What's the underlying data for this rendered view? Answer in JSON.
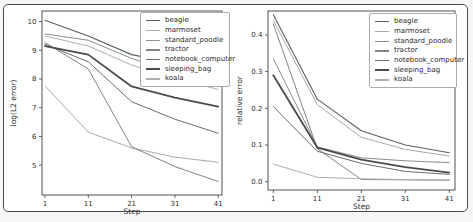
{
  "figure": {
    "background": "#ffffff",
    "frame_border_color": "#4a4a4a",
    "axis_color": "#3d3d3d",
    "text_color": "#2b2b2b"
  },
  "chart_data": [
    {
      "type": "line",
      "title": "",
      "xlabel": "Step",
      "ylabel": "log(L2 error)",
      "x": [
        1,
        11,
        21,
        31,
        41
      ],
      "xtick_labels": [
        "1",
        "11",
        "21",
        "31",
        "41"
      ],
      "ytick_values": [
        5,
        6,
        7,
        8,
        9,
        10
      ],
      "ytick_labels": [
        "5",
        "6",
        "7",
        "8",
        "9",
        "10"
      ],
      "xlim": [
        0.31,
        41.87
      ],
      "ylim": [
        3.96,
        10.37
      ],
      "grid": false,
      "legend_position": "upper right",
      "series": [
        {
          "name": "beagle",
          "color": "#566069",
          "width": 1.1,
          "values": [
            10.05,
            9.5,
            8.85,
            8.55,
            8.35
          ]
        },
        {
          "name": "marmoset",
          "color": "#a9a9a9",
          "width": 1.0,
          "values": [
            7.76,
            6.15,
            5.6,
            5.28,
            5.1
          ]
        },
        {
          "name": "standard_poodle",
          "color": "#879087",
          "width": 1.0,
          "values": [
            9.57,
            9.35,
            8.72,
            8.2,
            7.79
          ]
        },
        {
          "name": "tractor",
          "color": "#82828a",
          "width": 1.0,
          "values": [
            9.27,
            8.35,
            5.64,
            4.95,
            4.43
          ]
        },
        {
          "name": "notebook_computer",
          "color": "#6e6a67",
          "width": 1.0,
          "values": [
            9.21,
            8.6,
            7.21,
            6.6,
            6.11
          ]
        },
        {
          "name": "sleeping_bag",
          "color": "#4d4a49",
          "width": 1.8,
          "values": [
            9.15,
            8.85,
            7.74,
            7.35,
            7.04
          ]
        },
        {
          "name": "koala",
          "color": "#b2adb0",
          "width": 1.0,
          "values": [
            9.5,
            9.15,
            8.49,
            8.0,
            7.64
          ]
        }
      ]
    },
    {
      "type": "line",
      "title": "",
      "xlabel": "Step",
      "ylabel": "relative error",
      "x": [
        1,
        11,
        21,
        31,
        41
      ],
      "xtick_labels": [
        "1",
        "11",
        "21",
        "31",
        "41"
      ],
      "ytick_values": [
        0.0,
        0.1,
        0.2,
        0.3,
        0.4
      ],
      "ytick_labels": [
        "0.0",
        "0.1",
        "0.2",
        "0.3",
        "0.4"
      ],
      "xlim": [
        -0.205,
        42.3
      ],
      "ylim": [
        -0.0226,
        0.4652
      ],
      "grid": false,
      "legend_position": "upper right",
      "series": [
        {
          "name": "beagle",
          "color": "#566069",
          "width": 1.1,
          "values": [
            0.455,
            0.225,
            0.139,
            0.1,
            0.079
          ]
        },
        {
          "name": "marmoset",
          "color": "#a9a9a9",
          "width": 1.0,
          "values": [
            0.44,
            0.21,
            0.121,
            0.088,
            0.07
          ]
        },
        {
          "name": "standard_poodle",
          "color": "#879087",
          "width": 1.0,
          "values": [
            0.335,
            0.095,
            0.065,
            0.057,
            0.052
          ]
        },
        {
          "name": "tractor",
          "color": "#82828a",
          "width": 1.0,
          "values": [
            0.43,
            0.09,
            0.006,
            0.005,
            0.004
          ]
        },
        {
          "name": "notebook_computer",
          "color": "#6e6a67",
          "width": 1.0,
          "values": [
            0.205,
            0.083,
            0.05,
            0.028,
            0.02
          ]
        },
        {
          "name": "sleeping_bag",
          "color": "#4d4a49",
          "width": 1.8,
          "values": [
            0.29,
            0.093,
            0.06,
            0.04,
            0.025
          ]
        },
        {
          "name": "koala",
          "color": "#b2adb0",
          "width": 1.0,
          "values": [
            0.048,
            0.012,
            0.008,
            0.006,
            0.005
          ]
        }
      ]
    }
  ]
}
